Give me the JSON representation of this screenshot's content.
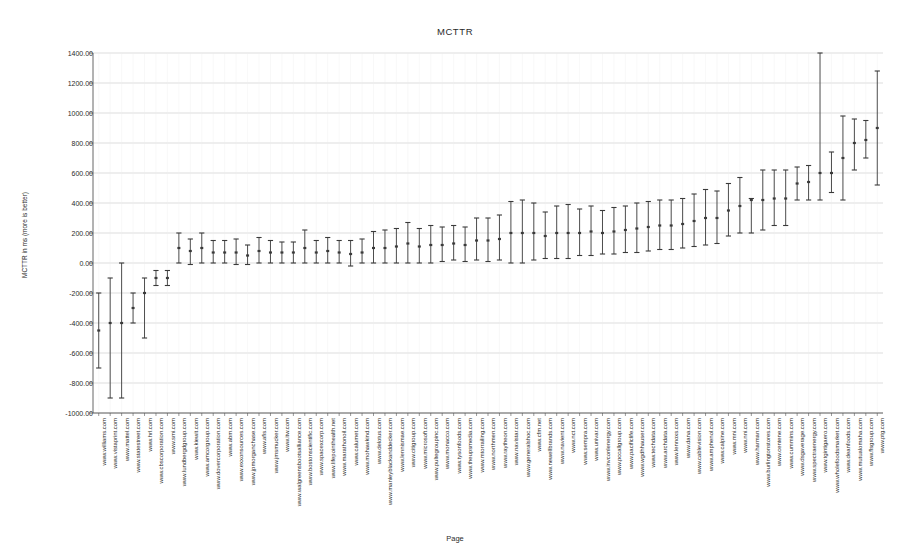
{
  "chart_data": {
    "type": "scatter",
    "title": "MCTTR",
    "xlabel": "Page",
    "ylabel": "MCTTR in ms (more is better)",
    "ylim": [
      -1000,
      1400
    ],
    "ytick_step": 200,
    "ytick_labels": [
      "1400.00",
      "1200.00",
      "1000.00",
      "800.00",
      "600.00",
      "400.00",
      "200.00",
      "0.00",
      "-200.00",
      "-400.00",
      "-600.00",
      "-800.00",
      "-1000.00"
    ],
    "grid": true,
    "legend": null,
    "marker_style": "error-bar-with-point",
    "series_name": "MCTTR",
    "categories": [
      "www.williams.com",
      "www.vistaprint.com",
      "www.mattel.com",
      "www.statestreet.com",
      "www.hrl.com",
      "www.cbscorporation.com",
      "www.smi.com",
      "www.lundbergdgroup.com",
      "www.kiewit.com",
      "www.amcorgroup.com",
      "www.dovercorporation.com",
      "www.abm.com",
      "www.exxonsources.com",
      "www.jpmorganchase.com",
      "www.afis.com",
      "www.jmsmucker.com",
      "www.itw.com",
      "www.walgreensbootsalliance.com",
      "www.bostonscientific.com",
      "www.spacexcorp.com",
      "www.lifepointhealth.net",
      "www.marathonoil.com",
      "www.calumet.com",
      "www.mohawkind.com",
      "www.delotus.com",
      "www.manleyblackanddecker.com",
      "www.lennismae.com",
      "www.citigroup.com",
      "www.microsoft.com",
      "www.pultegroupinc.com",
      "www.monacco.com",
      "www.tysonfoods.com",
      "www.theupsmedia.com",
      "www.mtorrailing.com",
      "www.northmen.com",
      "www.raytheon.com",
      "www.navistar.com",
      "www.generalshoc.com",
      "www.cfm.net",
      "www.newellbrands.com",
      "www.navient.com",
      "www.nct.com",
      "www.sempra.com",
      "www.univar.com",
      "www.invconlenergy.com",
      "www.pccallgroup.com",
      "www.pacificlife.com",
      "www.wgdhhauser.com",
      "www.techdata.com",
      "www.archdata.com",
      "www.lennoxs.com",
      "www.dana.com",
      "www.cablevision.com",
      "www.amphenol.com",
      "www.calpine.com",
      "www.mni.com",
      "www.nni.com",
      "www.harman.com",
      "www.burlingtonstores.com",
      "www.centene.com",
      "www.cummins.com",
      "www.dsgaverage.com",
      "www.spectraenergy.com",
      "www.tgintigaero.com",
      "www.wholefoodsmarket.com",
      "www.deanfoods.com",
      "www.mutualomaha.com",
      "www.flsgroup.com",
      "www.ptg.com"
    ],
    "values": [
      -450,
      -400,
      -400,
      -300,
      -200,
      -100,
      -100,
      100,
      80,
      100,
      70,
      70,
      70,
      50,
      80,
      70,
      70,
      70,
      100,
      70,
      80,
      70,
      60,
      70,
      100,
      100,
      110,
      130,
      110,
      120,
      120,
      130,
      120,
      150,
      150,
      160,
      200,
      200,
      200,
      180,
      200,
      200,
      200,
      210,
      200,
      210,
      220,
      230,
      240,
      250,
      250,
      260,
      280,
      300,
      300,
      350,
      380,
      420,
      420,
      430,
      430,
      530,
      540,
      600,
      600,
      700,
      800,
      820,
      900
    ],
    "err_low": [
      -700,
      -900,
      -900,
      -400,
      -500,
      -150,
      -150,
      0,
      -10,
      0,
      0,
      0,
      -10,
      -10,
      0,
      0,
      0,
      0,
      0,
      0,
      0,
      0,
      -20,
      0,
      0,
      0,
      0,
      0,
      0,
      0,
      10,
      20,
      10,
      20,
      10,
      20,
      0,
      0,
      20,
      30,
      30,
      30,
      50,
      50,
      60,
      60,
      70,
      70,
      80,
      90,
      90,
      100,
      110,
      120,
      130,
      180,
      200,
      200,
      220,
      250,
      250,
      420,
      420,
      420,
      470,
      420,
      620,
      700,
      520
    ],
    "err_high": [
      -200,
      -100,
      0,
      -200,
      -100,
      -50,
      -50,
      200,
      160,
      200,
      150,
      150,
      160,
      120,
      170,
      150,
      140,
      140,
      220,
      150,
      170,
      150,
      150,
      160,
      210,
      220,
      230,
      270,
      230,
      250,
      240,
      250,
      240,
      300,
      300,
      320,
      410,
      420,
      400,
      340,
      380,
      390,
      360,
      380,
      350,
      370,
      380,
      400,
      410,
      420,
      420,
      430,
      460,
      490,
      480,
      530,
      570,
      430,
      620,
      620,
      620,
      640,
      650,
      1400,
      740,
      980,
      960,
      950,
      1280
    ],
    "axis_color": "#555555",
    "grid_color": "#cfcfcf",
    "marker_color": "#3a3a3a"
  },
  "plot_geometry": {
    "left": 93,
    "top": 53,
    "width": 790,
    "height": 360
  }
}
